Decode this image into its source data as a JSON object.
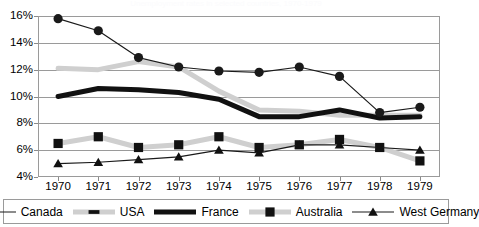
{
  "title": "Unemployment rates in selected countries, 1970-1979",
  "axis": {
    "y_ticks": [
      "16%",
      "14%",
      "12%",
      "10%",
      "8%",
      "6%",
      "4%"
    ],
    "x_ticks": [
      "1970",
      "1971",
      "1972",
      "1973",
      "1974",
      "1975",
      "1976",
      "1977",
      "1978",
      "1979"
    ]
  },
  "legend": {
    "items": [
      {
        "label": "Canada",
        "marker": "circle",
        "color": "#1a1a1a",
        "line_width": 1.2,
        "marker_size": 4.6
      },
      {
        "label": "USA",
        "marker": "dash",
        "color": "#cfcfcf",
        "line_width": 5.0,
        "marker_size": 3.4
      },
      {
        "label": "France",
        "marker": "none",
        "color": "#111111",
        "line_width": 5.0,
        "marker_size": 0
      },
      {
        "label": "Australia",
        "marker": "square",
        "color": "#cfcfcf",
        "line_width": 5.0,
        "marker_size": 4.6
      },
      {
        "label": "West Germany",
        "marker": "triangle",
        "color": "#1a1a1a",
        "line_width": 1.2,
        "marker_size": 4.6
      }
    ]
  },
  "chart_data": {
    "type": "line",
    "title": "Unemployment rates in selected countries, 1970-1979",
    "xlabel": "",
    "ylabel": "",
    "ylim": [
      4,
      16
    ],
    "ytick_step": 2,
    "grid": true,
    "legend_position": "bottom",
    "categories": [
      "1970",
      "1971",
      "1972",
      "1973",
      "1974",
      "1975",
      "1976",
      "1977",
      "1978",
      "1979"
    ],
    "series": [
      {
        "name": "Canada",
        "values": [
          15.8,
          14.9,
          12.9,
          12.2,
          11.9,
          11.8,
          12.2,
          11.5,
          8.8,
          9.2
        ]
      },
      {
        "name": "USA",
        "values": [
          12.1,
          12.0,
          12.6,
          12.2,
          10.4,
          9.0,
          8.9,
          8.6,
          8.6,
          8.6
        ]
      },
      {
        "name": "France",
        "values": [
          10.0,
          10.6,
          10.5,
          10.3,
          9.8,
          8.5,
          8.5,
          9.0,
          8.4,
          8.5
        ]
      },
      {
        "name": "Australia",
        "values": [
          6.5,
          7.0,
          6.2,
          6.4,
          7.0,
          6.2,
          6.4,
          6.8,
          6.2,
          5.2
        ]
      },
      {
        "name": "West Germany",
        "values": [
          5.0,
          5.1,
          5.3,
          5.5,
          6.0,
          5.8,
          6.4,
          6.4,
          6.2,
          6.0
        ]
      }
    ]
  }
}
